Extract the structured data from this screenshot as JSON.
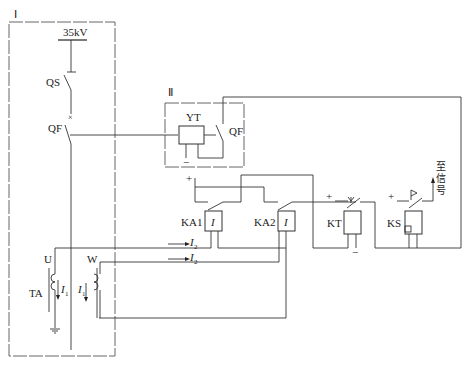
{
  "diagram": {
    "regions": {
      "primary": {
        "label": "Ⅰ"
      },
      "breaker_mechanism": {
        "label": "Ⅱ"
      }
    },
    "primary": {
      "bus_voltage": "35kV",
      "disconnector": "QS",
      "breaker": "QF",
      "ct_label": "TA",
      "phase_u": "U",
      "phase_w": "W",
      "primary_current": "I",
      "primary_current_sub": "1"
    },
    "mechanism": {
      "trip_coil": "YT",
      "aux_contact": "QF",
      "minus": "−"
    },
    "relays": {
      "ka1": {
        "label": "KA1",
        "symbol": "I"
      },
      "ka2": {
        "label": "KA2",
        "symbol": "I"
      },
      "kt": {
        "label": "KT"
      },
      "ks": {
        "label": "KS"
      },
      "plus": "+",
      "minus": "−"
    },
    "secondary_current": {
      "symbol": "I",
      "sub": "2"
    },
    "signal_output": {
      "lines": [
        "至",
        "信",
        "号"
      ]
    }
  }
}
